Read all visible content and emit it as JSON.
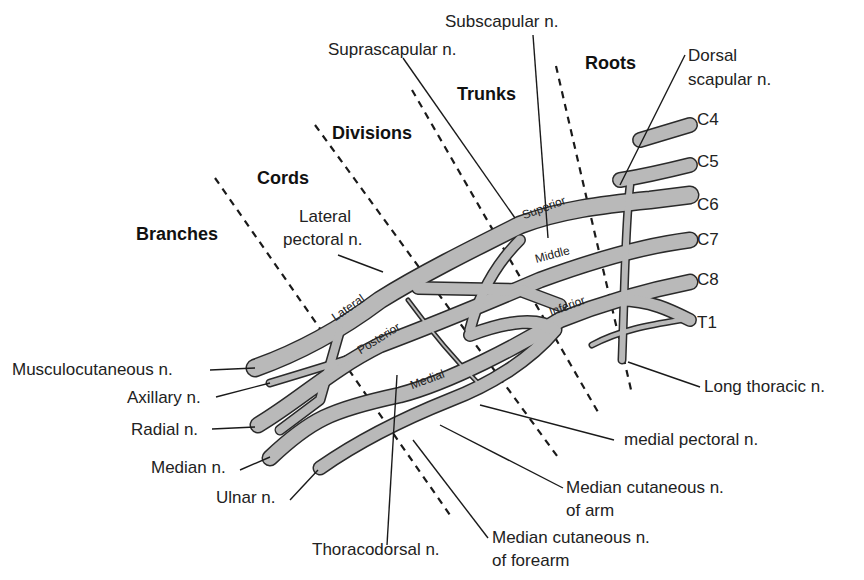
{
  "diagram": {
    "colors": {
      "nerve_fill": "#b9b9b9",
      "nerve_outline": "#2a2a2a",
      "background": "#ffffff",
      "text": "#222222"
    },
    "sections": {
      "roots": "Roots",
      "trunks": "Trunks",
      "divisions": "Divisions",
      "cords": "Cords",
      "branches": "Branches"
    },
    "roots": [
      "C4",
      "C5",
      "C6",
      "C7",
      "C8",
      "T1"
    ],
    "trunks": {
      "superior": "Superior",
      "middle": "Middle",
      "inferior": "Inferior"
    },
    "cords": {
      "lateral": "Lateral",
      "posterior": "Posterior",
      "medial": "Medial"
    },
    "labels": {
      "dorsal_scapular_1": "Dorsal",
      "dorsal_scapular_2": "scapular n.",
      "subscapular": "Subscapular n.",
      "suprascapular": "Suprascapular n.",
      "lateral_pectoral_1": "Lateral",
      "lateral_pectoral_2": "pectoral n.",
      "long_thoracic": "Long thoracic n.",
      "medial_pectoral": "medial pectoral n.",
      "median_cut_arm_1": "Median cutaneous n.",
      "median_cut_arm_2": "of arm",
      "median_cut_forearm_1": "Median cutaneous n.",
      "median_cut_forearm_2": "of forearm",
      "thoracodorsal": "Thoracodorsal n.",
      "musculocutaneous": "Musculocutaneous n.",
      "axillary": "Axillary n.",
      "radial": "Radial n.",
      "median": "Median n.",
      "ulnar": "Ulnar n."
    }
  }
}
